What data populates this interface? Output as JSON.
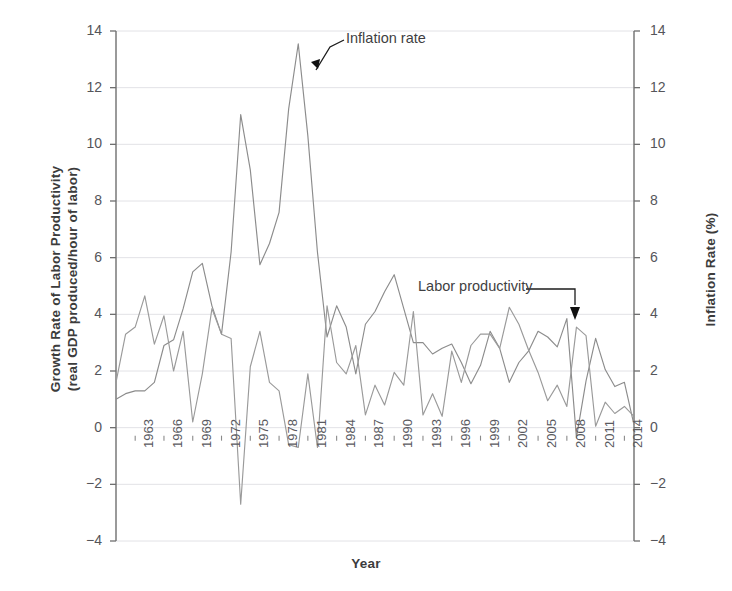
{
  "chart_data": {
    "type": "line",
    "title": "",
    "xlabel": "Year",
    "ylabel": "Growth Rate of Labor Productivity (real GDP produced/hour of labor)",
    "ylabel_right": "Inflation Rate (%)",
    "ylim": [
      -4,
      14
    ],
    "yticks": [
      -4,
      -2,
      0,
      2,
      4,
      6,
      8,
      10,
      12,
      14
    ],
    "yticks_right": [
      -4,
      -2,
      0,
      2,
      4,
      6,
      8,
      10,
      12,
      14
    ],
    "xlim": [
      1961,
      2015
    ],
    "xtick_labels": [
      "1963",
      "1966",
      "1969",
      "1972",
      "1975",
      "1978",
      "1981",
      "1984",
      "1987",
      "1990",
      "1993",
      "1996",
      "1999",
      "2002",
      "2005",
      "2008",
      "2011",
      "2014"
    ],
    "grid": "horizontal",
    "legend_position": "inline-annotations",
    "annotations": [
      {
        "text": "Inflation rate",
        "points_to_year": 1981,
        "points_to_value": 12.4
      },
      {
        "text": "Labor productivity",
        "points_to_year": 2009,
        "points_to_value": 3.5
      }
    ],
    "x": [
      1961,
      1962,
      1963,
      1964,
      1965,
      1966,
      1967,
      1968,
      1969,
      1970,
      1971,
      1972,
      1973,
      1974,
      1975,
      1976,
      1977,
      1978,
      1979,
      1980,
      1981,
      1982,
      1983,
      1984,
      1985,
      1986,
      1987,
      1988,
      1989,
      1990,
      1991,
      1992,
      1993,
      1994,
      1995,
      1996,
      1997,
      1998,
      1999,
      2000,
      2001,
      2002,
      2003,
      2004,
      2005,
      2006,
      2007,
      2008,
      2009,
      2010,
      2011,
      2012,
      2013,
      2014,
      2015
    ],
    "series": [
      {
        "name": "Inflation rate",
        "axis": "right",
        "color": "#8c8c8c",
        "values": [
          1.0,
          1.2,
          1.3,
          1.3,
          1.6,
          2.9,
          3.1,
          4.2,
          5.5,
          5.8,
          4.3,
          3.3,
          6.2,
          11.05,
          9.1,
          5.75,
          6.5,
          7.6,
          11.25,
          13.55,
          10.3,
          6.2,
          3.2,
          4.3,
          3.55,
          1.9,
          3.65,
          4.1,
          4.8,
          5.4,
          4.2,
          3.0,
          3.0,
          2.6,
          2.8,
          2.95,
          2.3,
          1.55,
          2.2,
          3.4,
          2.8,
          1.6,
          2.3,
          2.7,
          3.4,
          3.2,
          2.85,
          3.85,
          -0.35,
          1.65,
          3.15,
          2.05,
          1.45,
          1.6,
          0.1
        ]
      },
      {
        "name": "Labor productivity",
        "axis": "left",
        "color": "#9a9a9a",
        "values": [
          1.6,
          3.3,
          3.55,
          4.65,
          2.95,
          3.95,
          2.0,
          3.4,
          0.2,
          1.9,
          4.2,
          3.3,
          3.15,
          -2.7,
          2.15,
          3.4,
          1.6,
          1.3,
          -0.6,
          -0.7,
          1.9,
          -0.7,
          4.3,
          2.3,
          1.9,
          2.9,
          0.45,
          1.5,
          0.8,
          1.95,
          1.5,
          4.1,
          0.45,
          1.2,
          0.4,
          2.7,
          1.6,
          2.9,
          3.3,
          3.3,
          2.8,
          4.25,
          3.65,
          2.75,
          1.95,
          0.95,
          1.5,
          0.75,
          3.55,
          3.25,
          0.05,
          0.9,
          0.5,
          0.75,
          0.4
        ]
      }
    ]
  }
}
